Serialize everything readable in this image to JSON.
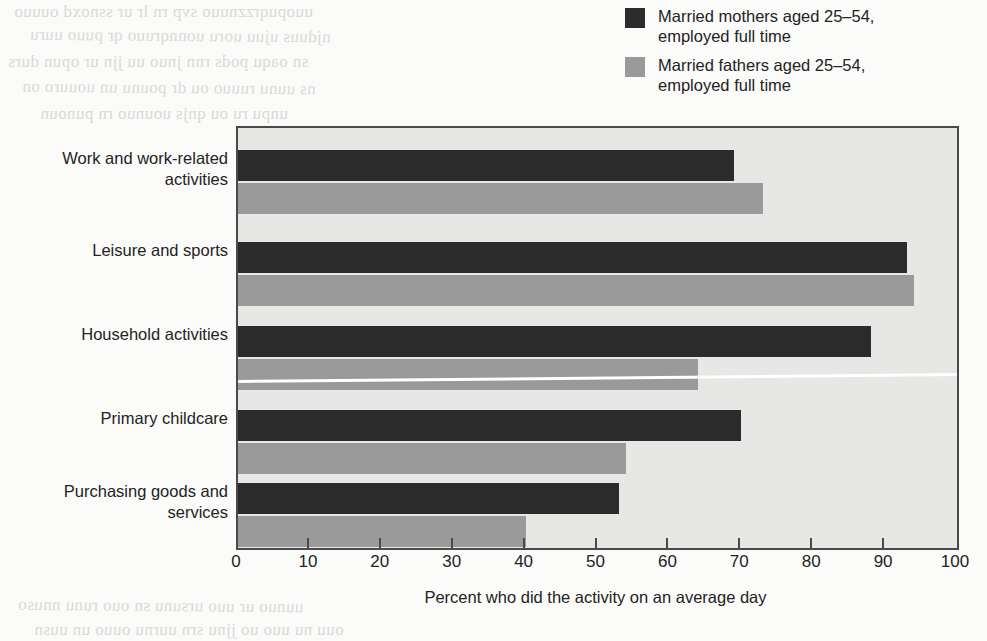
{
  "chart_data": {
    "type": "bar",
    "orientation": "horizontal",
    "title": "",
    "xlabel": "Percent who did the activity on an average day",
    "ylabel": "",
    "xlim": [
      0,
      100
    ],
    "xticks": [
      0,
      10,
      20,
      30,
      40,
      50,
      60,
      70,
      80,
      90,
      100
    ],
    "grid": false,
    "legend_position": "top-right",
    "categories": [
      "Work and work-related\nactivities",
      "Leisure and sports",
      "Household activities",
      "Primary childcare",
      "Purchasing goods and\nservices"
    ],
    "series": [
      {
        "name": "Married mothers aged 25–54,\nemployed full time",
        "color": "#2b2b2b",
        "values": [
          69,
          93,
          88,
          70,
          53
        ]
      },
      {
        "name": "Married fathers aged 25–54,\nemployed full time",
        "color": "#9a9a9a",
        "values": [
          73,
          94,
          64,
          54,
          40
        ]
      }
    ]
  },
  "legend": {
    "items": [
      {
        "label": "Married mothers aged 25–54,\nemployed full time",
        "color": "#2b2b2b"
      },
      {
        "label": "Married fathers aged 25–54,\nemployed full time",
        "color": "#9a9a9a"
      }
    ]
  },
  "axis": {
    "x_title": "Percent who did the activity on an average day",
    "x_tick_labels": [
      "0",
      "10",
      "20",
      "30",
      "40",
      "50",
      "60",
      "70",
      "80",
      "90",
      "100"
    ]
  },
  "background_text": [
    "a scanned page with faint show-through text",
    "from the reverse side of the printed sheet"
  ]
}
